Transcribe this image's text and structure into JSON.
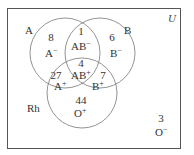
{
  "universe_label": "U",
  "sets": [
    {
      "name": "A",
      "label": "A"
    },
    {
      "name": "B",
      "label": "B"
    },
    {
      "name": "Rh",
      "label": "Rh"
    }
  ],
  "regions": {
    "a_neg": {
      "count": "8",
      "type_base": "A",
      "type_sign": "−"
    },
    "ab_neg": {
      "count": "1",
      "type_base": "AB",
      "type_sign": "−"
    },
    "b_neg": {
      "count": "6",
      "type_base": "B",
      "type_sign": "−"
    },
    "ab_pos": {
      "count": "4",
      "type_base": "AB",
      "type_sign": "+"
    },
    "a_pos": {
      "count": "27",
      "type_base": "A",
      "type_sign": "+"
    },
    "b_pos": {
      "count": "7",
      "type_base": "B",
      "type_sign": "+"
    },
    "o_pos": {
      "count": "44",
      "type_base": "O",
      "type_sign": "+"
    },
    "o_neg": {
      "count": "3",
      "type_base": "O",
      "type_sign": "−"
    }
  },
  "colors": {
    "frame": "#555555",
    "circle": "#777777",
    "text": "#333333"
  }
}
